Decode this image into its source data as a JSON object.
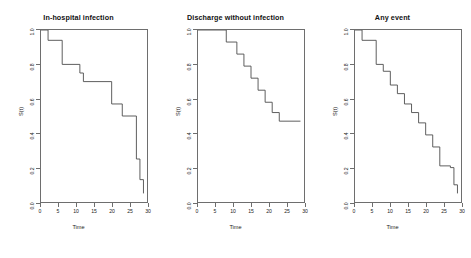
{
  "figure": {
    "background": "#ffffff",
    "line_color": "#4d4d4d",
    "frame_color": "#6e6e6e",
    "panel_count": 3
  },
  "chart_data": [
    {
      "type": "line",
      "subtype": "kaplan-meier-step",
      "title": "In-hospital infection",
      "xlabel": "Time",
      "ylabel": "S(t)",
      "xlim": [
        0,
        30
      ],
      "ylim": [
        0.0,
        1.0
      ],
      "xticks": [
        0,
        5,
        10,
        15,
        20,
        25,
        30
      ],
      "xticklabels": [
        "0",
        "5",
        "10",
        "15",
        "20",
        "25",
        "30"
      ],
      "yticks": [
        0.0,
        0.2,
        0.4,
        0.6,
        0.8,
        1.0
      ],
      "yticklabels": [
        "0.0",
        "0.2",
        "0.4",
        "0.6",
        "0.8",
        "1.0"
      ],
      "grid": false,
      "legend": "none",
      "x": [
        0,
        2,
        3,
        6,
        7,
        11,
        12,
        13,
        20,
        21,
        23,
        24,
        27,
        28,
        29
      ],
      "y": [
        1.0,
        1.0,
        0.94,
        0.94,
        0.8,
        0.8,
        0.75,
        0.7,
        0.7,
        0.57,
        0.57,
        0.5,
        0.5,
        0.25,
        0.13
      ],
      "steps": [
        {
          "time": 0,
          "survival": 1.0
        },
        {
          "time": 2,
          "survival": 0.94
        },
        {
          "time": 6,
          "survival": 0.8
        },
        {
          "time": 11,
          "survival": 0.75
        },
        {
          "time": 12,
          "survival": 0.7
        },
        {
          "time": 20,
          "survival": 0.57
        },
        {
          "time": 23,
          "survival": 0.5
        },
        {
          "time": 27,
          "survival": 0.25
        },
        {
          "time": 28,
          "survival": 0.13
        },
        {
          "time": 29,
          "survival": 0.05
        }
      ]
    },
    {
      "type": "line",
      "subtype": "kaplan-meier-step",
      "title": "Discharge without infection",
      "xlabel": "Time",
      "ylabel": "S(t)",
      "xlim": [
        0,
        30
      ],
      "ylim": [
        0.0,
        1.0
      ],
      "xticks": [
        0,
        5,
        10,
        15,
        20,
        25,
        30
      ],
      "xticklabels": [
        "0",
        "5",
        "10",
        "15",
        "20",
        "25",
        "30"
      ],
      "yticks": [
        0.0,
        0.2,
        0.4,
        0.6,
        0.8,
        1.0
      ],
      "yticklabels": [
        "0.0",
        "0.2",
        "0.4",
        "0.6",
        "0.8",
        "1.0"
      ],
      "grid": false,
      "legend": "none",
      "x": [
        0,
        8,
        11,
        13,
        15,
        17,
        19,
        21,
        23,
        29
      ],
      "y": [
        1.0,
        1.0,
        0.93,
        0.86,
        0.79,
        0.72,
        0.65,
        0.58,
        0.47,
        0.47
      ],
      "steps": [
        {
          "time": 0,
          "survival": 1.0
        },
        {
          "time": 8,
          "survival": 0.93
        },
        {
          "time": 11,
          "survival": 0.86
        },
        {
          "time": 13,
          "survival": 0.79
        },
        {
          "time": 15,
          "survival": 0.72
        },
        {
          "time": 17,
          "survival": 0.65
        },
        {
          "time": 19,
          "survival": 0.58
        },
        {
          "time": 21,
          "survival": 0.52
        },
        {
          "time": 23,
          "survival": 0.47
        },
        {
          "time": 29,
          "survival": 0.47
        }
      ]
    },
    {
      "type": "line",
      "subtype": "kaplan-meier-step",
      "title": "Any event",
      "xlabel": "Time",
      "ylabel": "S(t)",
      "xlim": [
        0,
        30
      ],
      "ylim": [
        0.0,
        1.0
      ],
      "xticks": [
        0,
        5,
        10,
        15,
        20,
        25,
        30
      ],
      "xticklabels": [
        "0",
        "5",
        "10",
        "15",
        "20",
        "25",
        "30"
      ],
      "yticks": [
        0.0,
        0.2,
        0.4,
        0.6,
        0.8,
        1.0
      ],
      "yticklabels": [
        "0.0",
        "0.2",
        "0.4",
        "0.6",
        "0.8",
        "1.0"
      ],
      "grid": false,
      "legend": "none",
      "x": [
        0,
        2,
        6,
        8,
        10,
        12,
        14,
        16,
        18,
        20,
        22,
        24,
        26,
        28,
        29
      ],
      "y": [
        1.0,
        0.94,
        0.8,
        0.76,
        0.68,
        0.63,
        0.57,
        0.52,
        0.46,
        0.39,
        0.32,
        0.21,
        0.2,
        0.1,
        0.05
      ],
      "steps": [
        {
          "time": 0,
          "survival": 1.0
        },
        {
          "time": 2,
          "survival": 0.94
        },
        {
          "time": 6,
          "survival": 0.8
        },
        {
          "time": 8,
          "survival": 0.76
        },
        {
          "time": 10,
          "survival": 0.68
        },
        {
          "time": 12,
          "survival": 0.63
        },
        {
          "time": 14,
          "survival": 0.57
        },
        {
          "time": 16,
          "survival": 0.52
        },
        {
          "time": 18,
          "survival": 0.46
        },
        {
          "time": 20,
          "survival": 0.39
        },
        {
          "time": 22,
          "survival": 0.32
        },
        {
          "time": 24,
          "survival": 0.21
        },
        {
          "time": 27,
          "survival": 0.2
        },
        {
          "time": 28,
          "survival": 0.1
        },
        {
          "time": 29,
          "survival": 0.05
        }
      ]
    }
  ]
}
